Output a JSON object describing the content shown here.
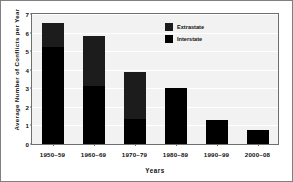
{
  "chart_data": {
    "type": "bar",
    "subtype": "stacked-bar",
    "title": "",
    "xlabel": "Years",
    "ylabel": "Average Number of Conflicts per Year",
    "categories": [
      "1950–59",
      "1960–69",
      "1970–79",
      "1980–89",
      "1990–99",
      "2000–08"
    ],
    "series": [
      {
        "name": "Interstate",
        "color": "#000000",
        "values": [
          5.25,
          3.15,
          1.35,
          3.0,
          1.27,
          0.75
        ]
      },
      {
        "name": "Extrastate",
        "color": "#1c1c1c",
        "values": [
          1.25,
          2.65,
          2.55,
          0,
          0,
          0
        ]
      }
    ],
    "stack_order_bottom_to_top": [
      "Interstate",
      "Extrastate"
    ],
    "totals": [
      6.5,
      5.8,
      3.9,
      3.0,
      1.27,
      0.75
    ],
    "ylim": [
      0,
      7
    ],
    "yticks": [
      0,
      1,
      2,
      3,
      4,
      5,
      6,
      7
    ],
    "ytick_labels": [
      "0",
      "1",
      "2",
      "3",
      "4",
      "5",
      "6",
      "7"
    ],
    "grid": "horizontal",
    "grid_color": "#ffffff",
    "plot_background": "#f2f2f2",
    "legend_position": "upper-right",
    "legend_entries": [
      {
        "label": "Extrastate",
        "color": "#1c1c1c"
      },
      {
        "label": "Interstate",
        "color": "#000000"
      }
    ]
  }
}
